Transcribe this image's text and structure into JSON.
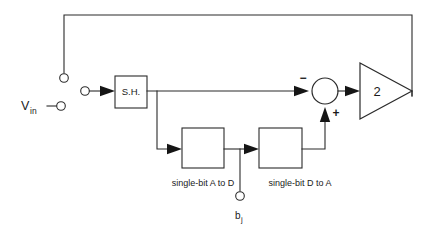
{
  "diagram": {
    "colors": {
      "line": "#2b2b2b",
      "text": "#1a1a1a",
      "background": "#ffffff"
    },
    "labels": {
      "input_signal": "V",
      "input_signal_sub": "in",
      "sample_hold": "S.H.",
      "adc_block": "single-bit  A to D",
      "dac_block": "single-bit D to A",
      "gain": "2",
      "sum_minus": "−",
      "sum_plus": "+",
      "bit_out": "b",
      "bit_out_sub": "j"
    },
    "nodes": [
      {
        "name": "feedback-terminal",
        "kind": "terminal",
        "x": 64,
        "y": 78
      },
      {
        "name": "vin-terminal",
        "kind": "terminal",
        "x": 61,
        "y": 106
      },
      {
        "name": "sh-input-terminal",
        "kind": "terminal",
        "x": 85,
        "y": 91
      },
      {
        "name": "bit-output-terminal",
        "kind": "terminal",
        "x": 240,
        "y": 196
      },
      {
        "name": "sample-hold-block",
        "kind": "box",
        "x": 115,
        "y": 76,
        "w": 32,
        "h": 32
      },
      {
        "name": "a-to-d-block",
        "kind": "box",
        "x": 182,
        "y": 128,
        "w": 42,
        "h": 40
      },
      {
        "name": "d-to-a-block",
        "kind": "box",
        "x": 259,
        "y": 128,
        "w": 43,
        "h": 40
      },
      {
        "name": "summing-junction",
        "kind": "circle",
        "x": 325,
        "y": 91,
        "r": 13
      },
      {
        "name": "gain-amplifier",
        "kind": "triangle",
        "x": 360,
        "y": 91,
        "w": 48,
        "h": 56
      }
    ]
  }
}
